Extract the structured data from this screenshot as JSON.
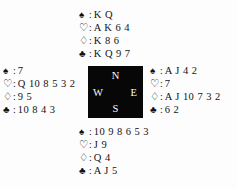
{
  "diagram": {
    "type": "bridge-deal",
    "background_color": "#fdfdfd",
    "ink_color": "#141414",
    "compass_box_color": "#070707",
    "compass_text_color": "#fbfbfb"
  },
  "suits": {
    "spade": {
      "glyph": "♠",
      "name": "spade-suit-symbol",
      "filled": true
    },
    "heart": {
      "glyph": "♡",
      "name": "heart-suit-symbol",
      "filled": false
    },
    "diamond": {
      "glyph": "♢",
      "name": "diamond-suit-symbol",
      "filled": false
    },
    "club": {
      "glyph": "♣",
      "name": "club-suit-symbol",
      "filled": true
    },
    "separator": ":"
  },
  "compass": {
    "north": "N",
    "west": "W",
    "east": "E",
    "south": "S"
  },
  "hands": {
    "north": {
      "label": "North",
      "spades": "K Q",
      "hearts": "A K 6 4",
      "diamonds": "K 8 6",
      "clubs": "K Q 9 7"
    },
    "west": {
      "label": "West",
      "spades": "7",
      "hearts": "Q 10 8 5 3 2",
      "diamonds": "9 5",
      "clubs": "10 8 4 3"
    },
    "east": {
      "label": "East",
      "spades": "A J 4 2",
      "hearts": "7",
      "diamonds": "A J 10 7 3 2",
      "clubs": "6 2"
    },
    "south": {
      "label": "South",
      "spades": "10 9 8 6 5 3",
      "hearts": "J 9",
      "diamonds": "Q 4",
      "clubs": "A J 5"
    }
  }
}
